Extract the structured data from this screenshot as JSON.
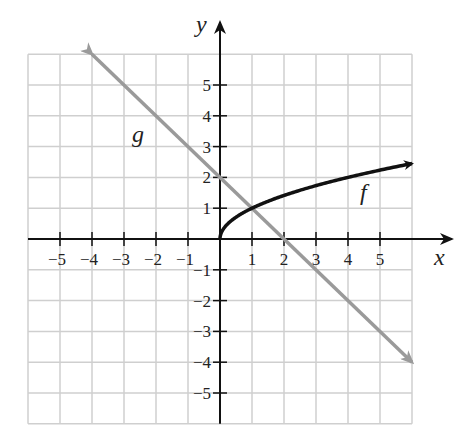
{
  "chart_data": {
    "type": "line",
    "title": "",
    "xlabel": "x",
    "ylabel": "y",
    "xlim": [
      -6,
      6
    ],
    "ylim": [
      -6,
      6
    ],
    "grid": true,
    "x_ticks": [
      -5,
      -4,
      -3,
      -2,
      -1,
      1,
      2,
      3,
      4,
      5
    ],
    "y_ticks": [
      5,
      4,
      3,
      2,
      1,
      -1,
      -2,
      -3,
      -4,
      -5
    ],
    "x_tick_labels": [
      "−5",
      "−4",
      "−3",
      "−2",
      "−1",
      "1",
      "2",
      "3",
      "4",
      "5"
    ],
    "y_tick_labels": [
      "5",
      "4",
      "3",
      "2",
      "1",
      "−1",
      "−2",
      "−3",
      "−4",
      "−5"
    ],
    "series": [
      {
        "name": "f",
        "label": "f",
        "color": "#111111",
        "formula": "f(x) = sqrt(x)",
        "x": [
          0,
          0.25,
          1,
          2.25,
          4,
          6
        ],
        "y": [
          0,
          0.5,
          1,
          1.5,
          2,
          2.45
        ],
        "arrow_end": true
      },
      {
        "name": "g",
        "label": "g",
        "color": "#9a9a9a",
        "formula": "g(x) = -x + 2",
        "x": [
          -4,
          6
        ],
        "y": [
          6,
          -4
        ],
        "arrow_start": true,
        "arrow_end": true
      }
    ],
    "intersection": {
      "x": 1,
      "y": 1
    }
  }
}
